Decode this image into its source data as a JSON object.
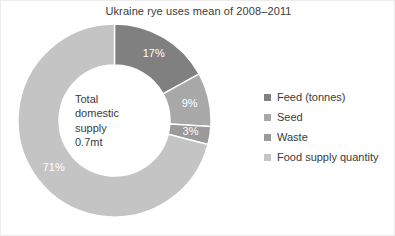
{
  "figure": {
    "background_color": "#ffffff",
    "border_color": "#ececec",
    "text_color": "#3a3a3a"
  },
  "chart_data": {
    "type": "pie",
    "variant": "donut",
    "title": "Ukraine rye uses mean of 2008–2011",
    "xlabel": "",
    "ylabel": "",
    "legend_position": "right",
    "grid": false,
    "center_label": {
      "lines": [
        "Total",
        "domestic",
        "supply",
        "0.7mt"
      ],
      "text": "Total domestic supply 0.7mt"
    },
    "units": "percent",
    "start_angle_deg": 0,
    "direction": "clockwise",
    "categories": [
      "Feed (tonnes)",
      "Seed",
      "Waste",
      "Food supply quantity"
    ],
    "values": [
      17,
      9,
      3,
      71
    ],
    "data_labels": [
      "17%",
      "9%",
      "3%",
      "71%"
    ],
    "colors": [
      "#808080",
      "#a8a8a8",
      "#9a9a9a",
      "#c4c4c4"
    ],
    "slices": [
      {
        "label": "Feed (tonnes)",
        "value": 17,
        "data_label": "17%",
        "color": "#808080",
        "label_text_color": "#ffffff"
      },
      {
        "label": "Seed",
        "value": 9,
        "data_label": "9%",
        "color": "#a8a8a8",
        "label_text_color": "#ffffff"
      },
      {
        "label": "Waste",
        "value": 3,
        "data_label": "3%",
        "color": "#9a9a9a",
        "label_text_color": "#ffffff"
      },
      {
        "label": "Food supply quantity",
        "value": 71,
        "data_label": "71%",
        "color": "#c4c4c4",
        "label_text_color": "#ffffff"
      }
    ]
  },
  "legend": {
    "items": [
      {
        "label": "Feed (tonnes)",
        "color": "#808080"
      },
      {
        "label": "Seed",
        "color": "#a8a8a8"
      },
      {
        "label": "Waste",
        "color": "#9a9a9a"
      },
      {
        "label": "Food supply quantity",
        "color": "#c4c4c4"
      }
    ]
  }
}
